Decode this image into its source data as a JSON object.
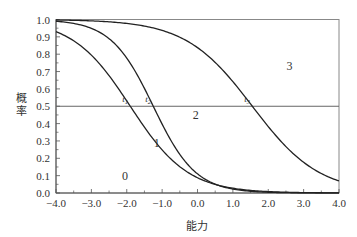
{
  "chart_data": {
    "type": "line",
    "title": "",
    "xlabel": "能力",
    "ylabel": "概率",
    "xlim": [
      -4.0,
      4.0
    ],
    "ylim": [
      0.0,
      1.0
    ],
    "grid": false,
    "legend": null,
    "x_ticks": [
      "-4.0",
      "-3.0",
      "-2.0",
      "-1.0",
      "0.0",
      "1.0",
      "2.0",
      "3.0",
      "4.0"
    ],
    "y_ticks": [
      "0.0",
      "0.1",
      "0.2",
      "0.3",
      "0.4",
      "0.5",
      "0.6",
      "0.7",
      "0.8",
      "0.9",
      "1.0"
    ],
    "reference_line": {
      "y": 0.5,
      "orientation": "horizontal"
    },
    "series": [
      {
        "name": "P(score≥1)",
        "threshold_label": "t1",
        "threshold": -1.9,
        "slope": 1.23,
        "points": [
          [
            -4.0,
            0.93
          ],
          [
            -3.0,
            0.8
          ],
          [
            -2.0,
            0.53
          ],
          [
            -1.9,
            0.5
          ],
          [
            -1.0,
            0.25
          ],
          [
            0.0,
            0.09
          ],
          [
            1.0,
            0.03
          ],
          [
            2.0,
            0.01
          ],
          [
            3.0,
            0.003
          ],
          [
            4.0,
            0.001
          ]
        ]
      },
      {
        "name": "P(score≥2)",
        "threshold_label": "t2",
        "threshold": -1.25,
        "slope": 1.67,
        "points": [
          [
            -4.0,
            0.99
          ],
          [
            -3.0,
            0.95
          ],
          [
            -2.0,
            0.78
          ],
          [
            -1.25,
            0.5
          ],
          [
            -1.0,
            0.4
          ],
          [
            0.0,
            0.11
          ],
          [
            1.0,
            0.02
          ],
          [
            2.0,
            0.004
          ],
          [
            3.0,
            0.001
          ],
          [
            4.0,
            0.0
          ]
        ]
      },
      {
        "name": "P(score≥3)",
        "threshold_label": "t3",
        "threshold": 1.55,
        "slope": 1.06,
        "points": [
          [
            -4.0,
            1.0
          ],
          [
            -3.0,
            0.99
          ],
          [
            -2.0,
            0.98
          ],
          [
            -1.0,
            0.94
          ],
          [
            0.0,
            0.84
          ],
          [
            1.0,
            0.64
          ],
          [
            1.55,
            0.5
          ],
          [
            2.0,
            0.38
          ],
          [
            3.0,
            0.18
          ],
          [
            4.0,
            0.07
          ]
        ]
      }
    ],
    "annotations": [
      {
        "text": "t",
        "sub": "1",
        "x": -1.9,
        "y": 0.5
      },
      {
        "text": "t",
        "sub": "2",
        "x": -1.25,
        "y": 0.5
      },
      {
        "text": "t",
        "sub": "3",
        "x": 1.55,
        "y": 0.5
      },
      {
        "text": "0",
        "x": -2.05,
        "y": 0.1
      },
      {
        "text": "1",
        "x": -1.15,
        "y": 0.29
      },
      {
        "text": "2",
        "x": -0.05,
        "y": 0.45
      },
      {
        "text": "3",
        "x": 2.6,
        "y": 0.73
      }
    ]
  }
}
